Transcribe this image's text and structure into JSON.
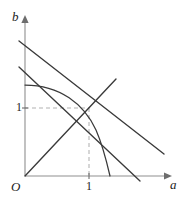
{
  "figure": {
    "background_color": "#ffffff",
    "axes": {
      "horizontal": {
        "name": "a-axis",
        "label": "a",
        "label_style": "italic",
        "color": "#8f8f8f",
        "origin_px": [
          25,
          176
        ],
        "end_px": [
          168,
          176
        ],
        "arrow": "right"
      },
      "vertical": {
        "name": "b-axis",
        "label": "b",
        "label_style": "italic",
        "color": "#8f8f8f",
        "origin_px": [
          25,
          176
        ],
        "end_px": [
          25,
          18
        ],
        "arrow": "up"
      },
      "origin_label": "O"
    },
    "ticks": [
      {
        "axis": "a",
        "label": "1",
        "x_px": 89,
        "y_px": 176
      },
      {
        "axis": "b",
        "label": "1",
        "x_px": 25,
        "y_px": 108
      }
    ],
    "unit_px": {
      "x": 64,
      "y": 68
    },
    "curves": [
      {
        "name": "arc-curve",
        "kind": "arc",
        "color": "#3a3a3a",
        "description": "Concave arc from b-axis intercept down to a-axis intercept passing right of the unit point",
        "start_px": [
          25,
          85
        ],
        "end_px": [
          110,
          176
        ],
        "control_px": [
          88,
          92
        ]
      }
    ],
    "lines": [
      {
        "name": "upper-descending-line",
        "color": "#3a3a3a",
        "slope_sign": "negative",
        "start_px": [
          19,
          41
        ],
        "end_px": [
          164,
          154
        ]
      },
      {
        "name": "lower-descending-line",
        "color": "#3a3a3a",
        "slope_sign": "negative",
        "start_px": [
          19,
          67
        ],
        "end_px": [
          140,
          181
        ]
      },
      {
        "name": "ascending-line-through-origin",
        "color": "#3a3a3a",
        "slope_sign": "positive",
        "start_px": [
          25,
          176
        ],
        "end_px": [
          116,
          79
        ]
      }
    ],
    "guides": [
      {
        "name": "horizontal-guide-to-unit-point",
        "style": "dashed",
        "color": "#b2b2b2",
        "start_px": [
          25,
          108
        ],
        "end_px": [
          89,
          108
        ]
      },
      {
        "name": "vertical-guide-to-unit-point",
        "style": "dashed",
        "color": "#b2b2b2",
        "start_px": [
          89,
          108
        ],
        "end_px": [
          89,
          176
        ]
      }
    ],
    "intersection_point_px": [
      89,
      108
    ]
  }
}
